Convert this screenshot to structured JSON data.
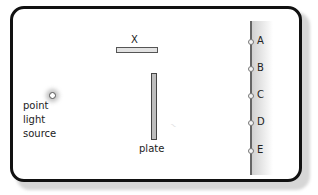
{
  "diagram": {
    "obstacle_label": "X",
    "plate_label": "plate",
    "source_label_lines": [
      "point",
      "light",
      "source"
    ],
    "screen_points": [
      "A",
      "B",
      "C",
      "D",
      "E"
    ],
    "faint_mark": "~"
  }
}
